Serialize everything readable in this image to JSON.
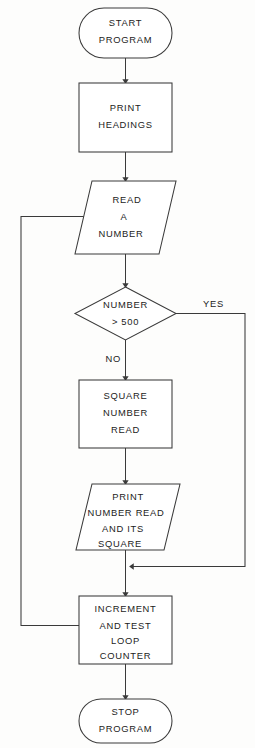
{
  "diagram": {
    "type": "flowchart",
    "line_color": "#3a3a3a",
    "text_color": "#1c1c1c",
    "background_color": "#fdfdfc"
  },
  "nodes": {
    "start": {
      "shape": "terminator",
      "lines": [
        "START",
        "PROGRAM"
      ],
      "line1": "START",
      "line2": "PROGRAM"
    },
    "print_headings": {
      "shape": "process",
      "lines": [
        "PRINT",
        "HEADINGS"
      ],
      "line1": "PRINT",
      "line2": "HEADINGS"
    },
    "read_number": {
      "shape": "input-output",
      "lines": [
        "READ",
        "A",
        "NUMBER"
      ],
      "line1": "READ",
      "line2": "A",
      "line3": "NUMBER"
    },
    "decision": {
      "shape": "decision",
      "lines": [
        "NUMBER",
        "> 500"
      ],
      "line1": "NUMBER",
      "line2": "> 500"
    },
    "square_number": {
      "shape": "process",
      "lines": [
        "SQUARE",
        "NUMBER",
        "READ"
      ],
      "line1": "SQUARE",
      "line2": "NUMBER",
      "line3": "READ"
    },
    "print_result": {
      "shape": "input-output",
      "lines": [
        "PRINT",
        "NUMBER READ",
        "AND ITS",
        "SQUARE"
      ],
      "line1": "PRINT",
      "line2": "NUMBER READ",
      "line3": "AND ITS",
      "line4": "SQUARE"
    },
    "increment_counter": {
      "shape": "process",
      "lines": [
        "INCREMENT",
        "AND  TEST",
        "LOOP",
        "COUNTER"
      ],
      "line1": "INCREMENT",
      "line2": "AND  TEST",
      "line3": "LOOP",
      "line4": "COUNTER"
    },
    "stop": {
      "shape": "terminator",
      "lines": [
        "STOP",
        "PROGRAM"
      ],
      "line1": "STOP",
      "line2": "PROGRAM"
    }
  },
  "branch_labels": {
    "no": "NO",
    "yes": "YES"
  }
}
